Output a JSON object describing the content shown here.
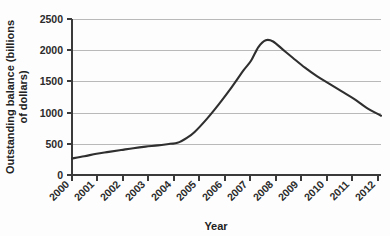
{
  "chart_data": {
    "type": "line",
    "title": "",
    "xlabel": "Year",
    "ylabel": "Outstanding balance (billions of dollars)",
    "ylabel_line1": "Outstanding balance (billions",
    "ylabel_line2": "of dollars)",
    "xlim": [
      2000,
      2012.6
    ],
    "ylim": [
      0,
      2500
    ],
    "grid": true,
    "legend": false,
    "x_tick_rotation": -45,
    "categories": [
      "2000",
      "2001",
      "2002",
      "2003",
      "2004",
      "2005",
      "2006",
      "2007",
      "2008",
      "2009",
      "2010",
      "2011",
      "2012"
    ],
    "y_ticks": [
      "0",
      "500",
      "1000",
      "1500",
      "2000",
      "2500"
    ],
    "y_tick_values": [
      0,
      500,
      1000,
      1500,
      2000,
      2500
    ],
    "series": [
      {
        "name": "Outstanding balance",
        "color": "#2f2f2f",
        "x": [
          2000,
          2000.5,
          2001,
          2001.5,
          2002,
          2002.5,
          2003,
          2003.5,
          2004,
          2004.3,
          2004.7,
          2005,
          2005.5,
          2006,
          2006.5,
          2007,
          2007.3,
          2007.6,
          2007.9,
          2008.2,
          2008.6,
          2009,
          2009.5,
          2010,
          2010.5,
          2011,
          2011.5,
          2012,
          2012.6
        ],
        "values": [
          265,
          300,
          340,
          370,
          400,
          430,
          455,
          475,
          500,
          515,
          600,
          690,
          900,
          1140,
          1400,
          1680,
          1830,
          2050,
          2160,
          2140,
          2010,
          1880,
          1720,
          1580,
          1460,
          1340,
          1220,
          1080,
          950
        ]
      }
    ]
  }
}
